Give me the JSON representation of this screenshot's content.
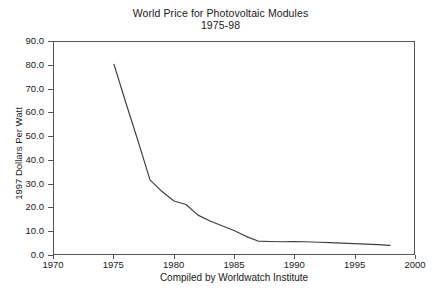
{
  "chart_data": {
    "type": "line",
    "title": "World Price for Photovoltaic Modules",
    "subtitle": "1975-98",
    "xlabel": "",
    "ylabel": "1997 Dollars Per Watt",
    "caption": "Compiled by Worldwatch Institute",
    "xlim": [
      1970,
      2000
    ],
    "ylim": [
      0.0,
      90.0
    ],
    "xticks": [
      "1970",
      "1975",
      "1980",
      "1985",
      "1990",
      "1995",
      "2000"
    ],
    "xtick_values": [
      1970,
      1975,
      1980,
      1985,
      1990,
      1995,
      2000
    ],
    "yticks": [
      "0.0",
      "10.0",
      "20.0",
      "30.0",
      "40.0",
      "50.0",
      "60.0",
      "70.0",
      "80.0",
      "90.0"
    ],
    "ytick_values": [
      0.0,
      10.0,
      20.0,
      30.0,
      40.0,
      50.0,
      60.0,
      70.0,
      80.0,
      90.0
    ],
    "grid": false,
    "legend": false,
    "line_color": "#404040",
    "series": [
      {
        "name": "World Price for Photovoltaic Modules",
        "x": [
          1975,
          1976,
          1977,
          1978,
          1979,
          1980,
          1981,
          1982,
          1983,
          1984,
          1985,
          1986,
          1987,
          1988,
          1989,
          1990,
          1991,
          1992,
          1993,
          1994,
          1995,
          1996,
          1997,
          1998
        ],
        "values": [
          80.5,
          64.0,
          48.0,
          31.5,
          26.5,
          22.5,
          21.0,
          16.5,
          14.0,
          12.0,
          10.0,
          7.5,
          5.5,
          5.3,
          5.2,
          5.3,
          5.2,
          5.0,
          4.8,
          4.6,
          4.4,
          4.2,
          4.0,
          3.7
        ]
      }
    ]
  }
}
